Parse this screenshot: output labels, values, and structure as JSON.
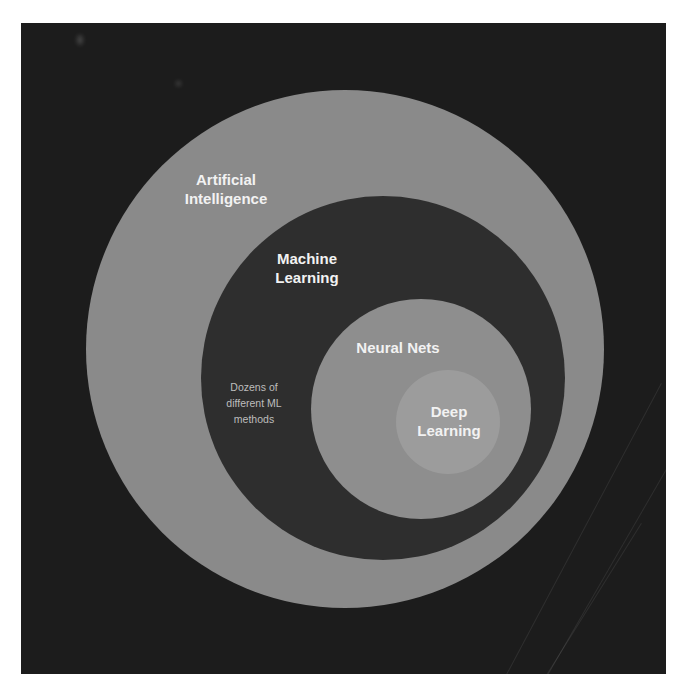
{
  "diagram": {
    "type": "nested-venn",
    "colors": {
      "background": "#1c1c1c",
      "ai_circle": "#8a8a8a",
      "ml_circle": "#2e2e2e",
      "nn_circle": "#8e8e8e",
      "dl_circle": "#9c9c9c",
      "label": "#f2f2f2",
      "note": "#bdbdbd"
    },
    "circles": [
      {
        "id": "ai",
        "label": "Artificial\nIntelligence"
      },
      {
        "id": "ml",
        "label": "Machine\nLearning",
        "note": "Dozens of\ndifferent ML\nmethods"
      },
      {
        "id": "nn",
        "label": "Neural Nets"
      },
      {
        "id": "dl",
        "label": "Deep\nLearning"
      }
    ]
  }
}
